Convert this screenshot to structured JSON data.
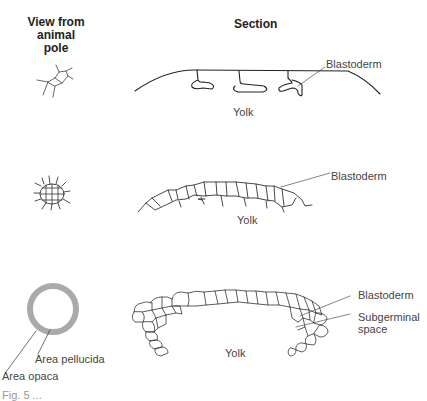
{
  "headers": {
    "left": "View from\nanimal pole",
    "left_line1": "View from",
    "left_line2": "animal pole",
    "right": "Section"
  },
  "rows": [
    {
      "stage": 1,
      "labels": {
        "blastoderm": "Blastoderm",
        "yolk": "Yolk"
      }
    },
    {
      "stage": 2,
      "labels": {
        "blastoderm": "Blastoderm",
        "yolk": "Yolk"
      }
    },
    {
      "stage": 3,
      "labels": {
        "blastoderm": "Blastoderm",
        "subgerminal_line1": "Subgerminal",
        "subgerminal_line2": "space",
        "yolk": "Yolk",
        "area_pellucida": "Area pellucida",
        "area_opaca": "Area opaca"
      }
    }
  ],
  "caption": "Fig. 5 ..."
}
